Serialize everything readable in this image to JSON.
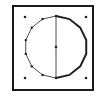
{
  "diagram": {
    "frame": {
      "x": 13,
      "y": 6,
      "w": 80,
      "h": 84,
      "stroke": "#1a1a1a",
      "stroke_width": 2
    },
    "circle": {
      "cx": 56,
      "cy": 47,
      "r": 31,
      "sides": 14
    },
    "corner_dots": [
      [
        25,
        17
      ],
      [
        86,
        17
      ],
      [
        25,
        78
      ],
      [
        86,
        78
      ]
    ],
    "center_dot": [
      56,
      47
    ],
    "colors": {
      "line": "#222222",
      "background": "#ffffff"
    }
  }
}
